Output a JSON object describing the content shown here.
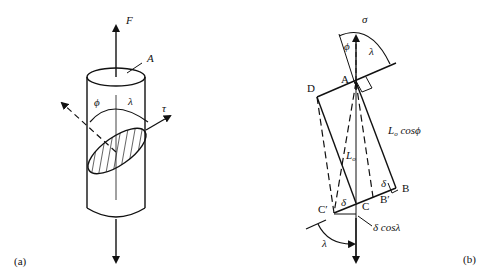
{
  "figure": {
    "panel_a": {
      "label": "(a)",
      "force": "F",
      "area": "A",
      "phi": "ϕ",
      "lambda": "λ",
      "tau": "τ"
    },
    "panel_b": {
      "label": "(b)",
      "sigma": "σ",
      "phi": "ϕ",
      "lambda_top": "λ",
      "lambda_bottom": "λ",
      "point_A": "A",
      "point_B": "B",
      "point_B_prime": "B′",
      "point_C": "C",
      "point_C_prime": "C′",
      "point_D": "D",
      "L0_cos_phi": "L",
      "L0_cos_phi_sub": "o",
      "L0_cos_phi_rest": " cosϕ",
      "L0": "L",
      "L0_sub": "o",
      "delta_1": "δ",
      "delta_2": "δ",
      "delta_cos_lambda": "δ cosλ"
    }
  }
}
